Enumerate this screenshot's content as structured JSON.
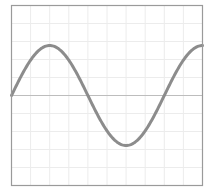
{
  "chart_data": {
    "type": "line",
    "title": "",
    "xlabel": "",
    "ylabel": "",
    "function": "sine",
    "x": [
      0,
      0.5,
      1,
      1.5,
      2,
      2.5,
      3,
      3.5,
      4,
      4.5,
      5,
      5.5,
      6,
      6.5,
      7,
      7.5,
      8,
      8.5,
      9,
      9.5,
      10
    ],
    "series": [
      {
        "name": "sine wave",
        "values": [
          0,
          0.38,
          0.71,
          0.92,
          1.0,
          0.92,
          0.71,
          0.38,
          0,
          -0.38,
          -0.71,
          -0.92,
          -1.0,
          -0.92,
          -0.71,
          -0.38,
          0,
          0.38,
          0.71,
          0.92,
          1.0
        ],
        "color": "#8c8c8c"
      }
    ],
    "xlim": [
      0,
      10
    ],
    "ylim": [
      -1.8,
      1.8
    ],
    "periods_shown": 1.25,
    "grid": true,
    "grid_divisions": {
      "x": 10,
      "y": 10
    },
    "zero_line": true,
    "legend": null
  },
  "colors": {
    "border": "#9a9a9a",
    "grid": "#ececec",
    "zero_line": "#bdbdbd",
    "curve": "#8c8c8c",
    "background": "#ffffff"
  }
}
